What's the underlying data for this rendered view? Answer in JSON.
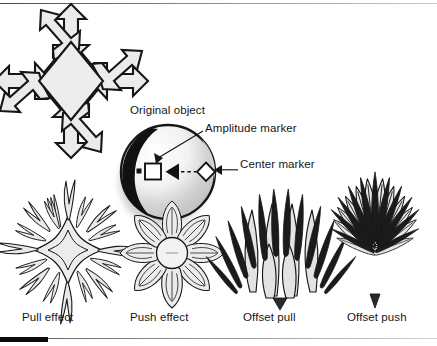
{
  "figure": {
    "kind": "technical-illustration",
    "background_color": "#ffffff",
    "ink_color": "#14161a",
    "fill_gray": "#e9e9e9",
    "callouts": [
      {
        "id": "original-object",
        "label": "Original object",
        "x": 130,
        "y": 109
      },
      {
        "id": "amplitude-marker",
        "label": "Amplitude marker",
        "x": 205,
        "y": 127
      },
      {
        "id": "center-marker",
        "label": "Center marker",
        "x": 240,
        "y": 164
      }
    ],
    "captions": [
      {
        "id": "pull-effect",
        "label": "Pull effect",
        "x": 22,
        "y": 318
      },
      {
        "id": "push-effect",
        "label": "Push effect",
        "x": 130,
        "y": 318
      },
      {
        "id": "offset-pull",
        "label": "Offset pull",
        "x": 243,
        "y": 318
      },
      {
        "id": "offset-push",
        "label": "Offset push",
        "x": 347,
        "y": 318
      }
    ],
    "markers": {
      "amplitude_marker_shape": "square-outline",
      "center_marker_shape": "diamond-outline",
      "direction_arrow_shape": "triangle-left",
      "connector_style": "dashed"
    },
    "shapes": [
      {
        "id": "original-object",
        "name": "eight-arrow-star",
        "cx": 71,
        "cy": 81
      },
      {
        "id": "sphere",
        "name": "shaded-sphere",
        "cx": 168,
        "cy": 172
      },
      {
        "id": "pull-effect-shape",
        "name": "spiky-star",
        "cx": 68,
        "cy": 250
      },
      {
        "id": "push-effect-shape",
        "name": "lobed-flower",
        "cx": 172,
        "cy": 253
      },
      {
        "id": "offset-pull-shape",
        "name": "upward-spike-cluster",
        "cx": 280,
        "cy": 250
      },
      {
        "id": "offset-push-shape",
        "name": "upward-petal-fan",
        "cx": 375,
        "cy": 250
      }
    ],
    "rules": {
      "top_rule": true,
      "bottom_rule": true,
      "bottom_tab_color": "#0a0a0a"
    }
  }
}
